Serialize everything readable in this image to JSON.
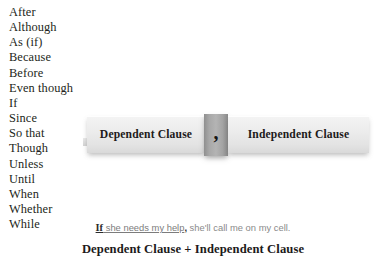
{
  "conjunction_list": {
    "name": "subordinating-conjunctions",
    "items": [
      "After",
      "Although",
      "As (if)",
      "Because",
      "Before",
      "Even though",
      "If",
      "Since",
      "So that",
      "Though",
      "Unless",
      "Until",
      "When",
      "Whether",
      "While"
    ]
  },
  "clause_bar": {
    "dependent_label": "Dependent Clause",
    "separator": ",",
    "independent_label": "Independent Clause"
  },
  "example": {
    "conjunction": "If",
    "dependent_clause": " she needs my help",
    "comma": ",",
    "independent_clause": " she'll call me on my cell."
  },
  "formula": {
    "text": "Dependent Clause + Independent Clause"
  },
  "colors": {
    "box_light": "#ececec",
    "box_edge": "#d9d9d9",
    "comma_tab": "#a8a8a8",
    "text_dark": "#231f20",
    "text_muted": "#7c7c7c",
    "background": "#ffffff"
  }
}
